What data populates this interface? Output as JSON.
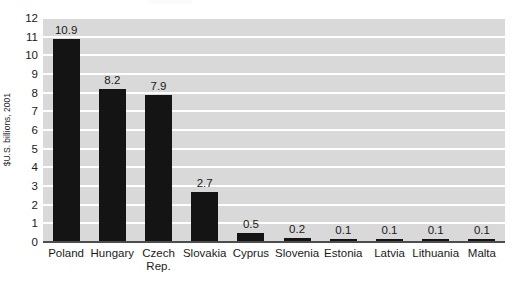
{
  "chart_data": {
    "type": "bar",
    "title": "",
    "xlabel": "",
    "ylabel": "$U.S. billions, 2001",
    "ylim": [
      0,
      12
    ],
    "yticks": [
      0,
      1,
      2,
      3,
      4,
      5,
      6,
      7,
      8,
      9,
      10,
      11,
      12
    ],
    "ytick_labels": [
      "0",
      "1",
      "2",
      "3",
      "4",
      "5",
      "6",
      "7",
      "8",
      "9",
      "10",
      "11",
      "12"
    ],
    "grid": true,
    "grid_color": "#ffffff",
    "plot_background": "#d9d9d9",
    "bar_color": "#141414",
    "legend": null,
    "categories": [
      "Poland",
      "Hungary",
      "Czech\nRep.",
      "Slovakia",
      "Cyprus",
      "Slovenia",
      "Estonia",
      "Latvia",
      "Lithuania",
      "Malta"
    ],
    "values": [
      10.9,
      8.2,
      7.9,
      2.7,
      0.5,
      0.2,
      0.1,
      0.1,
      0.1,
      0.1
    ],
    "data_labels": [
      "10.9",
      "8.2",
      "7.9",
      "2.7",
      "0.5",
      "0.2",
      "0.1",
      "0.1",
      "0.1",
      "0.1"
    ]
  }
}
